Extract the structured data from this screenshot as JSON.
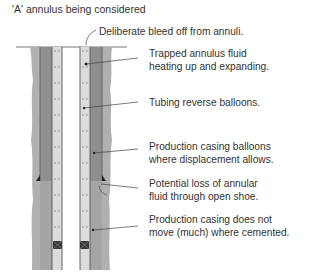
{
  "title": "'A' annulus being considered",
  "annotations": {
    "bleed_off": "Deliberate bleed off from annuli.",
    "trapped_fluid_1": "Trapped annulus fluid",
    "trapped_fluid_2": "heating up and expanding.",
    "tubing_reverse": "Tubing reverse balloons.",
    "casing_balloons_1": "Production casing balloons",
    "casing_balloons_2": "where displacement allows.",
    "loss_1": "Potential loss of annular",
    "loss_2": "fluid through open shoe.",
    "cemented_1": "Production casing does not",
    "cemented_2": "move (much) where cemented."
  },
  "colors": {
    "formation": "#a9a9a9",
    "cement": "#8f8f8f",
    "annulus_fluid": "#d9d9d9",
    "steel": "#555555",
    "packer": "#3a3a3a"
  }
}
